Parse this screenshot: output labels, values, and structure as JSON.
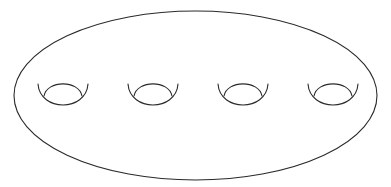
{
  "diagram": {
    "stroke_color": "#2a2a2a",
    "background_color": "#ffffff",
    "stroke_width": 1.1,
    "outline": {
      "shape": "ellipse",
      "cx": 195.5,
      "cy": 95.5,
      "rx": 181.5,
      "ry": 84.5
    },
    "holes": [
      {
        "id": 1,
        "cx": 63
      },
      {
        "id": 2,
        "cx": 153
      },
      {
        "id": 3,
        "cx": 243
      },
      {
        "id": 4,
        "cx": 333
      }
    ],
    "hole_geometry": {
      "outer_half_width": 25,
      "outer_top_y": 84,
      "outer_bottom_y": 102,
      "inner_half_width": 19,
      "inner_join_y": 96,
      "inner_top_y": 84
    }
  }
}
